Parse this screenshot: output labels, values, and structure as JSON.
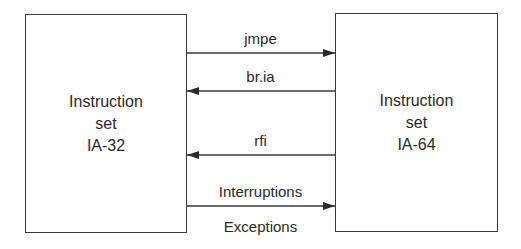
{
  "diagram": {
    "left_box": {
      "lines": [
        "Instruction",
        "set",
        "IA-32"
      ]
    },
    "right_box": {
      "lines": [
        "Instruction",
        "set",
        "IA-64"
      ]
    },
    "arrows": [
      {
        "label": "jmpe",
        "direction": "left-to-right"
      },
      {
        "label": "br.ia",
        "direction": "right-to-left"
      },
      {
        "label": "rfi",
        "direction": "right-to-left"
      },
      {
        "label": "Interruptions",
        "label_below": "Exceptions",
        "direction": "left-to-right"
      }
    ]
  }
}
